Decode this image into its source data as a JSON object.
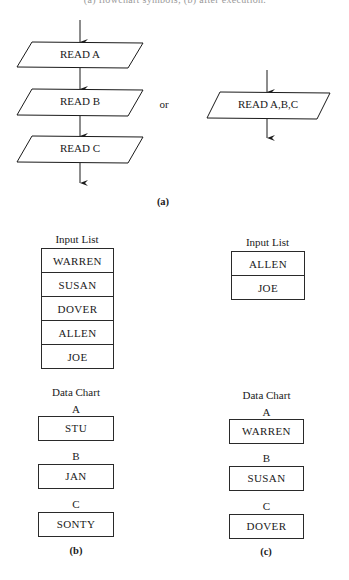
{
  "header_cut_text": "(a) flowchart symbols; (b) after execution.",
  "part_a": {
    "caption": "(a)",
    "separate_reads": [
      {
        "label": "READ A"
      },
      {
        "label": "READ B"
      },
      {
        "label": "READ C"
      }
    ],
    "or_label": "or",
    "combined_read": {
      "label": "READ A,B,C"
    }
  },
  "part_b": {
    "caption": "(b)",
    "input_list": {
      "title": "Input List",
      "items": [
        "WARREN",
        "SUSAN",
        "DOVER",
        "ALLEN",
        "JOE"
      ]
    },
    "data_chart": {
      "title": "Data Chart",
      "variables": [
        {
          "name": "A",
          "value": "STU"
        },
        {
          "name": "B",
          "value": "JAN"
        },
        {
          "name": "C",
          "value": "SONTY"
        }
      ]
    }
  },
  "part_c": {
    "caption": "(c)",
    "input_list": {
      "title": "Input List",
      "items": [
        "ALLEN",
        "JOE"
      ]
    },
    "data_chart": {
      "title": "Data Chart",
      "variables": [
        {
          "name": "A",
          "value": "WARREN"
        },
        {
          "name": "B",
          "value": "SUSAN"
        },
        {
          "name": "C",
          "value": "DOVER"
        }
      ]
    }
  }
}
